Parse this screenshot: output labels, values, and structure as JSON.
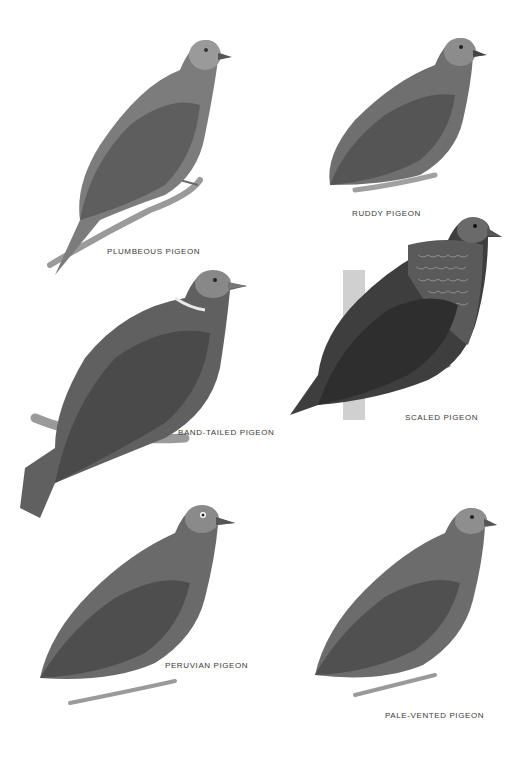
{
  "plate": {
    "species": [
      {
        "id": "plumbeous",
        "label": "PLUMBEOUS PIGEON",
        "tone": "#7c7c7c",
        "wing": "#5e5e5e",
        "head": "#9a9a9a"
      },
      {
        "id": "ruddy",
        "label": "RUDDY PIGEON",
        "tone": "#6f6f6f",
        "wing": "#555555",
        "head": "#8c8c8c"
      },
      {
        "id": "band-tailed",
        "label": "BAND-TAILED PIGEON",
        "tone": "#606060",
        "wing": "#4a4a4a",
        "head": "#888888"
      },
      {
        "id": "scaled",
        "label": "SCALED PIGEON",
        "tone": "#3e3e3e",
        "wing": "#2e2e2e",
        "head": "#6a6a6a"
      },
      {
        "id": "peruvian",
        "label": "PERUVIAN PIGEON",
        "tone": "#6a6a6a",
        "wing": "#4e4e4e",
        "head": "#8a8a8a"
      },
      {
        "id": "pale-vented",
        "label": "PALE-VENTED PIGEON",
        "tone": "#6c6c6c",
        "wing": "#505050",
        "head": "#8e8e8e"
      }
    ]
  }
}
